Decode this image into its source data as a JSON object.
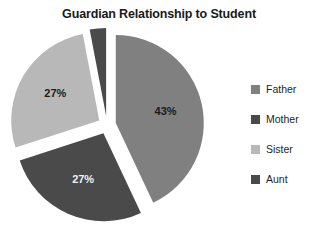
{
  "chart_data": {
    "type": "pie",
    "title": "Guardian Relationship to Student",
    "xlabel": "",
    "ylabel": "",
    "legend_position": "right",
    "grid": false,
    "exploded": true,
    "categories": [
      "Father",
      "Mother",
      "Sister",
      "Aunt"
    ],
    "values": [
      43,
      27,
      27,
      3
    ],
    "value_labels": [
      "43%",
      "27%",
      "27%",
      "3%"
    ],
    "colors": [
      "#808080",
      "#4a4a4a",
      "#b8b8b8",
      "#4a4a4a"
    ],
    "slices": [
      {
        "name": "Father",
        "value": 43,
        "label": "43%",
        "color": "#808080",
        "start_angle": 0,
        "end_angle": 154.8,
        "label_color": "dark"
      },
      {
        "name": "Mother",
        "value": 27,
        "label": "27%",
        "color": "#4a4a4a",
        "start_angle": 154.8,
        "end_angle": 252.0,
        "label_color": "light"
      },
      {
        "name": "Sister",
        "value": 27,
        "label": "27%",
        "color": "#b8b8b8",
        "start_angle": 252.0,
        "end_angle": 349.2,
        "label_color": "dark"
      },
      {
        "name": "Aunt",
        "value": 3,
        "label": "3%",
        "color": "#4a4a4a",
        "start_angle": 349.2,
        "end_angle": 360.0,
        "label_color": "dark"
      }
    ]
  },
  "legend": {
    "items": [
      {
        "label": "Father",
        "color": "#808080"
      },
      {
        "label": "Mother",
        "color": "#4a4a4a"
      },
      {
        "label": "Sister",
        "color": "#b8b8b8"
      },
      {
        "label": "Aunt",
        "color": "#4a4a4a"
      }
    ]
  }
}
